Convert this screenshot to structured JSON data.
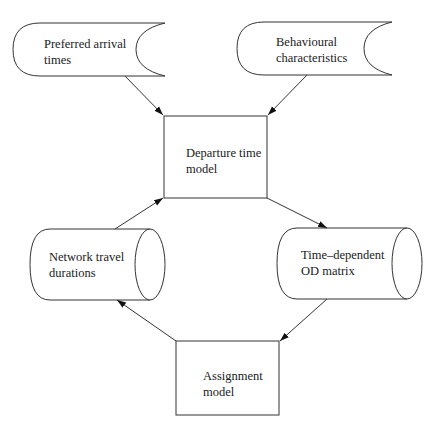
{
  "diagram": {
    "type": "flowchart",
    "nodes": [
      {
        "id": "preferred",
        "shape": "stored-data",
        "lines": [
          "Preferred arrival",
          "times"
        ]
      },
      {
        "id": "behavioural",
        "shape": "stored-data",
        "lines": [
          "Behavioural",
          "characteristics"
        ]
      },
      {
        "id": "departure",
        "shape": "rectangle",
        "lines": [
          "Departure time",
          "model"
        ]
      },
      {
        "id": "network",
        "shape": "cylinder",
        "lines": [
          "Network travel",
          "durations"
        ]
      },
      {
        "id": "od",
        "shape": "cylinder",
        "lines": [
          "Time–dependent",
          "OD matrix"
        ]
      },
      {
        "id": "assignment",
        "shape": "rectangle",
        "lines": [
          "Assignment",
          "model"
        ]
      }
    ],
    "edges": [
      {
        "from": "preferred",
        "to": "departure"
      },
      {
        "from": "behavioural",
        "to": "departure"
      },
      {
        "from": "network",
        "to": "departure"
      },
      {
        "from": "departure",
        "to": "od"
      },
      {
        "from": "od",
        "to": "assignment"
      },
      {
        "from": "assignment",
        "to": "network"
      }
    ],
    "colors": {
      "stroke": "#333333",
      "background": "#ffffff",
      "text": "#1a1a1a"
    }
  }
}
